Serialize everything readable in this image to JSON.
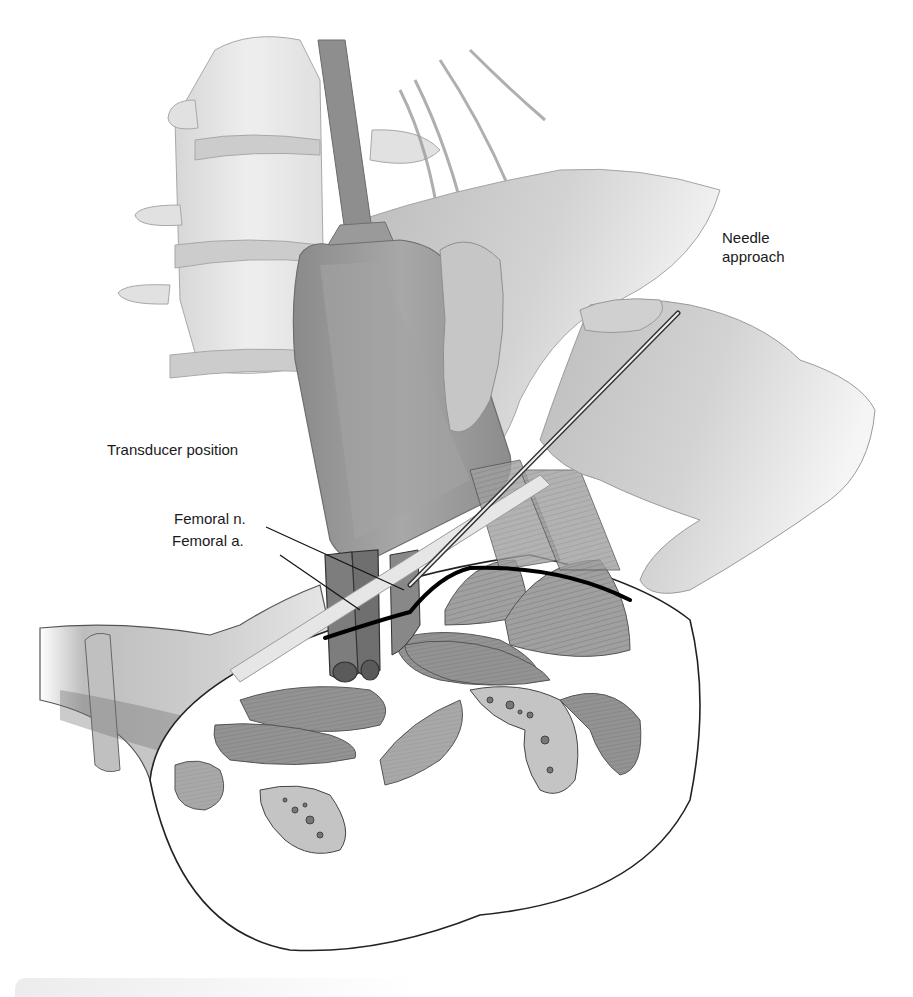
{
  "figure": {
    "style": "grayscale anatomical illustration",
    "colors": {
      "background": "#ffffff",
      "label_text": "#1a1a1a",
      "skin": "#c8c8c8",
      "transducer": "#9a9a9a",
      "muscle": "#8f8f8f",
      "bone": "#d9d9d9",
      "outline": "#2a2a2a",
      "fascia_line": "#000000"
    }
  },
  "labels": {
    "needle_line1": "Needle",
    "needle_line2": "approach",
    "transducer": "Transducer position",
    "femoral_nerve": "Femoral n.",
    "femoral_artery": "Femoral a."
  },
  "structures": [
    "lumbar vertebrae",
    "ultrasound transducer with cable",
    "operator hand",
    "needle",
    "femoral nerve",
    "femoral artery",
    "fascia iliaca line",
    "thigh cross-section with muscles and femur"
  ]
}
